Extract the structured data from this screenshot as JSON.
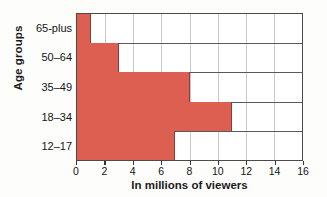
{
  "chart_data": {
    "type": "bar",
    "orientation": "horizontal",
    "title": "",
    "xlabel": "In millions of viewers",
    "ylabel": "Age groups",
    "categories": [
      "12–17",
      "18–34",
      "35–49",
      "50–64",
      "65-plus"
    ],
    "values": [
      7,
      11,
      8,
      3,
      1
    ],
    "xlim": [
      0,
      16
    ],
    "xticks": [
      0,
      2,
      4,
      6,
      8,
      10,
      12,
      14,
      16
    ],
    "xtick_labels": [
      "0",
      "2",
      "4",
      "6",
      "8",
      "10",
      "12",
      "14",
      "16"
    ],
    "grid": true,
    "grid_axis": "both",
    "legend": false,
    "bar_color": "#dc5f52",
    "bar_edge_color": "#8d3b33",
    "grid_color": "#c9c9c9",
    "frame_color": "#4a4a4a",
    "background": "#ffffff"
  }
}
